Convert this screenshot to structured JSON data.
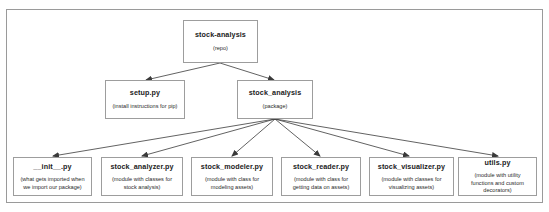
{
  "diagram": {
    "type": "tree",
    "frame": {
      "border_color": "#9a9a9a",
      "background": "#ffffff"
    },
    "edge_color": "#3a3a3a",
    "node_border_color": "#9d9d9d",
    "nodes": {
      "root": {
        "title": "stock-analysis",
        "subtitle": "(repo)"
      },
      "setup": {
        "title": "setup.py",
        "subtitle": "(install instructions for pip)"
      },
      "package": {
        "title": "stock_analysis",
        "subtitle": "(package)"
      },
      "init": {
        "title": "__init__.py",
        "subtitle": "(what gets imported when we import our package)"
      },
      "analyzer": {
        "title": "stock_analyzer.py",
        "subtitle": "(module with classes for stock analysis)"
      },
      "modeler": {
        "title": "stock_modeler.py",
        "subtitle": "(module with class for modeling assets)"
      },
      "reader": {
        "title": "stock_reader.py",
        "subtitle": "(module with class for getting data on assets)"
      },
      "visualizer": {
        "title": "stock_visualizer.py",
        "subtitle": "(module with classes for visualizing assets)"
      },
      "utils": {
        "title": "utils.py",
        "subtitle": "(module with utility functions and custom decorators)"
      }
    },
    "edges": [
      {
        "from": "root",
        "to": "setup"
      },
      {
        "from": "root",
        "to": "package"
      },
      {
        "from": "package",
        "to": "init"
      },
      {
        "from": "package",
        "to": "analyzer"
      },
      {
        "from": "package",
        "to": "modeler"
      },
      {
        "from": "package",
        "to": "reader"
      },
      {
        "from": "package",
        "to": "visualizer"
      },
      {
        "from": "package",
        "to": "utils"
      }
    ]
  }
}
